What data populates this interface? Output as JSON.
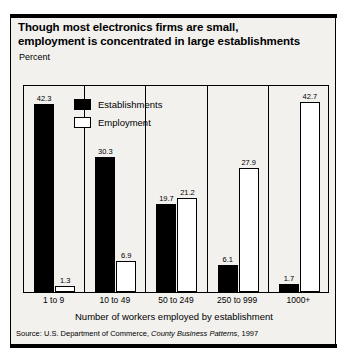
{
  "title": {
    "line1": "Though most electronics firms are small,",
    "line2": "employment is concentrated in large establishments"
  },
  "ylabel": "Percent",
  "xlabel": "Number of workers employed by establishment",
  "source": {
    "prefix": "Source: U.S. Department of Commerce, ",
    "italic": "County Business Patterns",
    "suffix": ", 1997"
  },
  "legend": [
    {
      "label": "Establishments",
      "style": "dark"
    },
    {
      "label": "Employment",
      "style": "light"
    }
  ],
  "chart_data": {
    "type": "bar",
    "title": "Though most electronics firms are small, employment is concentrated in large establishments",
    "xlabel": "Number of workers employed by establishment",
    "ylabel": "Percent",
    "categories": [
      "1 to 9",
      "10 to 49",
      "50 to 249",
      "250 to 999",
      "1000+"
    ],
    "series": [
      {
        "name": "Establishments",
        "values": [
          42.3,
          30.3,
          19.7,
          6.1,
          1.7
        ]
      },
      {
        "name": "Employment",
        "values": [
          1.3,
          6.9,
          21.2,
          27.9,
          42.7
        ]
      }
    ],
    "ylim": [
      0,
      45
    ],
    "grid": false,
    "legend_position": "inside-top-left",
    "data_labels": [
      "42.3",
      "1.3",
      "30.3",
      "6.9",
      "19.7",
      "21.2",
      "6.1",
      "27.9",
      "1.7",
      "42.7"
    ]
  }
}
